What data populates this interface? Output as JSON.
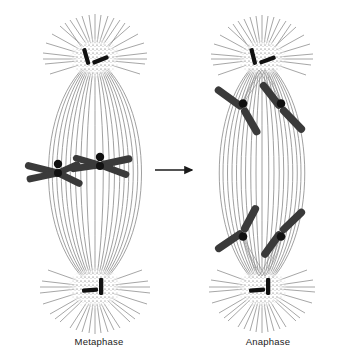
{
  "figure": {
    "background_color": "#ffffff",
    "line_color": "#8c8c8c",
    "chromosome_color": "#3a3a3a",
    "centriole_color": "#111111",
    "arrow_color": "#1a1a1a",
    "text_color": "#1a1a1a"
  },
  "panels": [
    {
      "id": "metaphase",
      "label": "Metaphase",
      "description": "Spindle with chromosomes aligned at the equatorial metaphase plate",
      "cell_center_x": 95,
      "cell_center_y": 175,
      "pole_top_y": 58,
      "pole_bottom_y": 288,
      "spindle_half_width": 62,
      "spindle_fiber_count": 17,
      "aster_ray_count": 26,
      "centrosomes": [
        {
          "name": "top-centrosome",
          "x": 95,
          "y": 58,
          "centriole_pair": "crossed"
        },
        {
          "name": "bottom-centrosome",
          "x": 95,
          "y": 288,
          "centriole_pair": "perpendicular"
        }
      ],
      "chromosomes": [
        {
          "name": "chromosome-1",
          "form": "x-shaped",
          "centromere_x": 58,
          "centromere_y": 173,
          "arm_count": 4
        },
        {
          "name": "chromosome-2",
          "form": "x-shaped",
          "centromere_x": 100,
          "centromere_y": 165,
          "arm_count": 4
        }
      ]
    },
    {
      "id": "anaphase",
      "label": "Anaphase",
      "description": "Sister chromatids separated and moving as V shapes toward opposite poles",
      "cell_center_x": 262,
      "cell_center_y": 175,
      "pole_top_y": 58,
      "pole_bottom_y": 288,
      "spindle_half_width": 57,
      "spindle_fiber_count": 17,
      "aster_ray_count": 26,
      "centrosomes": [
        {
          "name": "top-centrosome",
          "x": 262,
          "y": 58,
          "centriole_pair": "crossed"
        },
        {
          "name": "bottom-centrosome",
          "x": 262,
          "y": 288,
          "centriole_pair": "perpendicular"
        }
      ],
      "chromosomes": [
        {
          "name": "chromatid-top-left",
          "form": "v-shaped",
          "centromere_x": 243,
          "centromere_y": 104,
          "pointing": "up"
        },
        {
          "name": "chromatid-top-right",
          "form": "v-shaped",
          "centromere_x": 280,
          "centromere_y": 104,
          "pointing": "up"
        },
        {
          "name": "chromatid-bottom-left",
          "form": "v-shaped",
          "centromere_x": 243,
          "centromere_y": 236,
          "pointing": "down"
        },
        {
          "name": "chromatid-bottom-right",
          "form": "v-shaped",
          "centromere_x": 280,
          "centromere_y": 236,
          "pointing": "down"
        }
      ]
    }
  ],
  "arrow": {
    "name": "transition-arrow",
    "direction": "right",
    "x_start": 155,
    "x_end": 196,
    "y": 170
  }
}
